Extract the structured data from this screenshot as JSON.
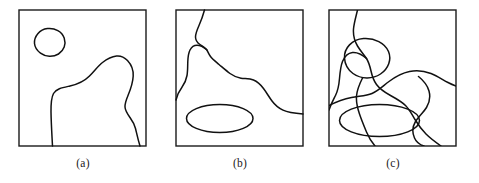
{
  "figure": {
    "width": 479,
    "height": 183,
    "background": "#ffffff",
    "stroke_color": "#111111",
    "frame_color": "#1a1a1a",
    "caption_color": "#1a1a1a"
  },
  "panels": [
    {
      "id": "a",
      "caption": "(a)",
      "frame": {
        "x": 19,
        "y": 10,
        "width": 127,
        "height": 136
      },
      "caption_position": {
        "x": 83,
        "y": 157
      },
      "shapes": [
        {
          "name": "small-closed-blob",
          "type": "closed-contour",
          "bbox": {
            "x": 34,
            "y": 28,
            "width": 31,
            "height": 28
          },
          "path": "M 34.5 43.5 C 34.0 36.5 39.5 29.5 47.5 28.6 C 55.0 27.8 62.0 31.5 64.2 38.0 C 66.3 44.3 64.0 50.5 58.5 54.0 C 53.0 57.4 45.5 57.0 40.5 53.2 C 36.6 50.2 34.8 47.0 34.5 43.5 Z"
        },
        {
          "name": "large-lower-contour",
          "type": "open-contour",
          "endpoints": [
            {
              "x": 52,
              "y": 146
            },
            {
              "x": 140,
              "y": 146
            }
          ],
          "path": "M 52.5 146 C 52.0 136 51.2 124 51.0 112 C 50.9 104 51.4 97.5 53.5 93.5 C 56.2 88.5 63.0 87.5 70.0 86.0 C 78.0 84.2 84.5 81.0 89.5 76.0 C 94.5 71.0 98.0 66.0 102.5 62.5 C 107.0 59.0 112.0 56.5 116.5 56.0 C 121.0 55.5 124.5 57.4 127.5 60.5 C 131.0 64.2 133.5 69.5 133.2 76.0 C 132.9 82.5 130.5 89.5 128.0 95.5 C 126.2 99.8 124.8 103.5 125.0 107.0 C 125.2 110.8 127.5 114.0 130.0 117.5 C 132.5 121.0 134.5 124.5 135.5 128.5 C 136.5 132.5 137.8 139.0 140 146"
        }
      ]
    },
    {
      "id": "b",
      "caption": "(b)",
      "frame": {
        "x": 176,
        "y": 10,
        "width": 127,
        "height": 136
      },
      "caption_position": {
        "x": 240,
        "y": 157
      },
      "shapes": [
        {
          "name": "upper-branching-curve",
          "type": "open-curve",
          "endpoints": [
            {
              "x": 204,
              "y": 10
            },
            {
              "x": 303,
              "y": 114
            }
          ],
          "path": "M 204.5 10 C 203.0 15.5 201.0 21.0 199.0 25.5 C 197.0 30.0 195.5 33.5 195.5 37.0 C 195.5 40.5 197.5 42.8 200.0 44.5 C 202.5 46.2 205.0 47.5 206.5 49.5 C 208.0 51.5 208.6 54.0 210.5 56.5 C 212.5 59.2 215.5 61.5 219.0 64.5 C 222.8 67.7 226.5 71.0 230.0 73.5 C 233.5 76.0 237.0 77.6 241.0 78.2 C 245.0 78.8 249.5 78.5 253.5 80.0 C 257.5 81.5 260.5 84.5 263.5 88.5 C 266.5 92.5 269.0 97.0 272.0 101.0 C 275.0 105.0 278.5 108.0 283.0 110.2 C 287.5 112.4 294.5 113.4 303 114"
        },
        {
          "name": "left-descending-branch",
          "type": "open-curve",
          "endpoints": [
            {
              "x": 206,
              "y": 49
            },
            {
              "x": 176,
              "y": 100
            }
          ],
          "path": "M 206.8 49.8 C 203.5 47.0 200.0 45.2 197.0 45.2 C 194.0 45.2 191.5 47.0 190.0 50.0 C 188.5 53.0 188.0 57.0 187.8 61.5 C 187.6 66.0 187.8 71.0 187.0 75.5 C 186.2 80.0 184.5 84.0 181.8 87.5 C 179.5 90.5 177.8 93.0 176 100"
        },
        {
          "name": "horizontal-ellipse",
          "type": "closed-contour",
          "bbox": {
            "x": 186,
            "y": 104,
            "width": 67,
            "height": 29
          },
          "path": "M 186.5 118.5 C 186.5 110.8 201.5 104.5 219.8 104.5 C 238.0 104.5 253.0 110.8 253.0 118.5 C 253.0 126.2 238.0 132.5 219.8 132.5 C 201.5 132.5 186.5 126.2 186.5 118.5 Z"
        }
      ]
    },
    {
      "id": "c",
      "caption": "(c)",
      "frame": {
        "x": 329,
        "y": 10,
        "width": 127,
        "height": 136
      },
      "caption_position": {
        "x": 393,
        "y": 157
      },
      "shapes": [
        {
          "name": "overlay-small-blob",
          "type": "closed-contour",
          "bbox": {
            "x": 344,
            "y": 38,
            "width": 46,
            "height": 41
          },
          "path": "M 344.5 58.0 C 344.0 48.0 352.0 39.5 363.5 38.6 C 374.5 37.8 385.0 43.0 388.5 51.5 C 391.8 59.5 388.5 68.5 380.5 74.0 C 372.5 79.4 361.0 79.2 353.0 73.5 C 347.2 69.3 344.8 63.5 344.5 58.0 Z"
        },
        {
          "name": "overlay-horizontal-ellipse",
          "type": "closed-contour",
          "bbox": {
            "x": 339,
            "y": 104,
            "width": 81,
            "height": 33
          },
          "path": "M 339.5 120.5 C 339.5 111.5 357.5 104.5 379.5 104.5 C 401.5 104.5 419.5 111.5 419.5 120.5 C 419.5 129.5 401.5 136.5 379.5 136.5 C 357.5 136.5 339.5 129.5 339.5 120.5 Z"
        },
        {
          "name": "overlay-upper-branching-curve",
          "type": "open-curve",
          "endpoints": [
            {
              "x": 357,
              "y": 10
            },
            {
              "x": 456,
              "y": 114
            }
          ],
          "path": "M 357.5 10 C 356.0 16.5 354.0 23.0 353.5 29.0 C 353.0 35.5 354.5 41.0 357.5 46.0 C 360.5 51.0 364.0 54.5 366.5 58.5 C 369.0 62.5 370.0 66.5 371.0 71.0 C 372.0 75.5 373.5 80.5 376.5 84.5 C 380.0 89.2 385.0 92.5 390.5 95.5 C 396.0 98.5 401.5 101.5 405.5 105.5 C 409.5 109.5 412.0 114.5 415.0 119.5 C 418.0 124.5 421.5 129.5 426.0 134.0 C 430.5 138.5 436.0 142.5 441 146"
        },
        {
          "name": "overlay-left-descending-curve",
          "type": "open-curve",
          "endpoints": [
            {
              "x": 366,
              "y": 58
            },
            {
              "x": 329,
              "y": 110
            }
          ],
          "path": "M 366.5 58.5 C 362.0 54.5 357.0 52.0 352.5 52.5 C 348.0 53.0 344.5 56.5 342.5 61.5 C 340.5 66.5 340.0 72.5 339.5 78.5 C 339.0 84.5 338.0 90.5 335.5 95.5 C 333.5 99.5 331.5 103.0 329 110"
        },
        {
          "name": "overlay-long-diagonal-curve",
          "type": "open-curve",
          "endpoints": [
            {
              "x": 329,
              "y": 105
            },
            {
              "x": 456,
              "y": 86
            }
          ],
          "path": "M 329 105.5 C 336.0 102.0 344.0 99.0 351.5 97.5 C 359.0 96.0 366.0 96.0 372.0 93.5 C 378.0 91.0 383.0 86.0 389.0 81.5 C 395.0 77.0 402.0 73.0 409.5 71.5 C 417.0 70.0 424.5 71.0 431.0 73.5 C 437.5 76.0 443.0 80.0 448.0 82.5 C 451.5 84.3 453.8 85.2 456 86"
        },
        {
          "name": "overlay-lower-vertical-curve",
          "type": "open-curve",
          "endpoints": [
            {
              "x": 362,
              "y": 78
            },
            {
              "x": 375,
              "y": 146
            }
          ],
          "path": "M 362.5 78.0 C 359.5 84.0 357.0 90.0 356.5 96.0 C 356.0 102.0 357.5 108.0 359.5 114.0 C 361.5 120.0 364.0 126.0 366.5 132.0 C 369.0 138.0 372.0 142.5 375 146"
        },
        {
          "name": "overlay-right-vertical-curve",
          "type": "open-curve",
          "endpoints": [
            {
              "x": 418,
              "y": 76
            },
            {
              "x": 424,
              "y": 146
            }
          ],
          "path": "M 418.5 76.5 C 423.5 80.5 427.5 85.5 429.0 91.0 C 430.5 96.5 429.5 102.5 426.5 107.5 C 423.5 112.5 418.5 116.5 415.5 121.5 C 412.5 126.5 412.0 132.5 414.5 138.0 C 416.5 142.4 420.0 144.8 424 146"
        }
      ]
    }
  ]
}
